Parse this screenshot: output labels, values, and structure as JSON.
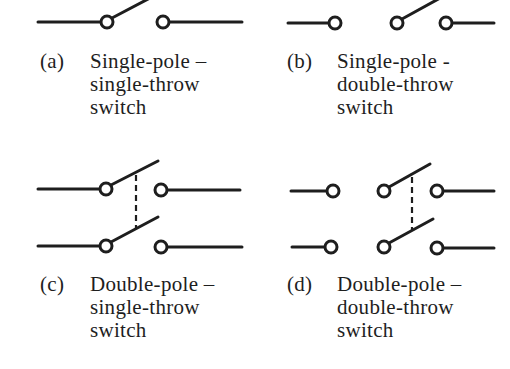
{
  "figure": {
    "stroke_color": "#1e1e1e",
    "panels": [
      {
        "id": "a",
        "tag": "(a)",
        "lines": [
          "Single-pole –",
          "single-throw",
          "switch"
        ],
        "poles": 1,
        "throws": 1
      },
      {
        "id": "b",
        "tag": "(b)",
        "lines": [
          "Single-pole -",
          "double-throw",
          "switch"
        ],
        "poles": 1,
        "throws": 2
      },
      {
        "id": "c",
        "tag": "(c)",
        "lines": [
          "Double-pole –",
          "single-throw",
          "switch"
        ],
        "poles": 2,
        "throws": 1
      },
      {
        "id": "d",
        "tag": "(d)",
        "lines": [
          "Double-pole –",
          "double-throw",
          "switch"
        ],
        "poles": 2,
        "throws": 2
      }
    ]
  }
}
